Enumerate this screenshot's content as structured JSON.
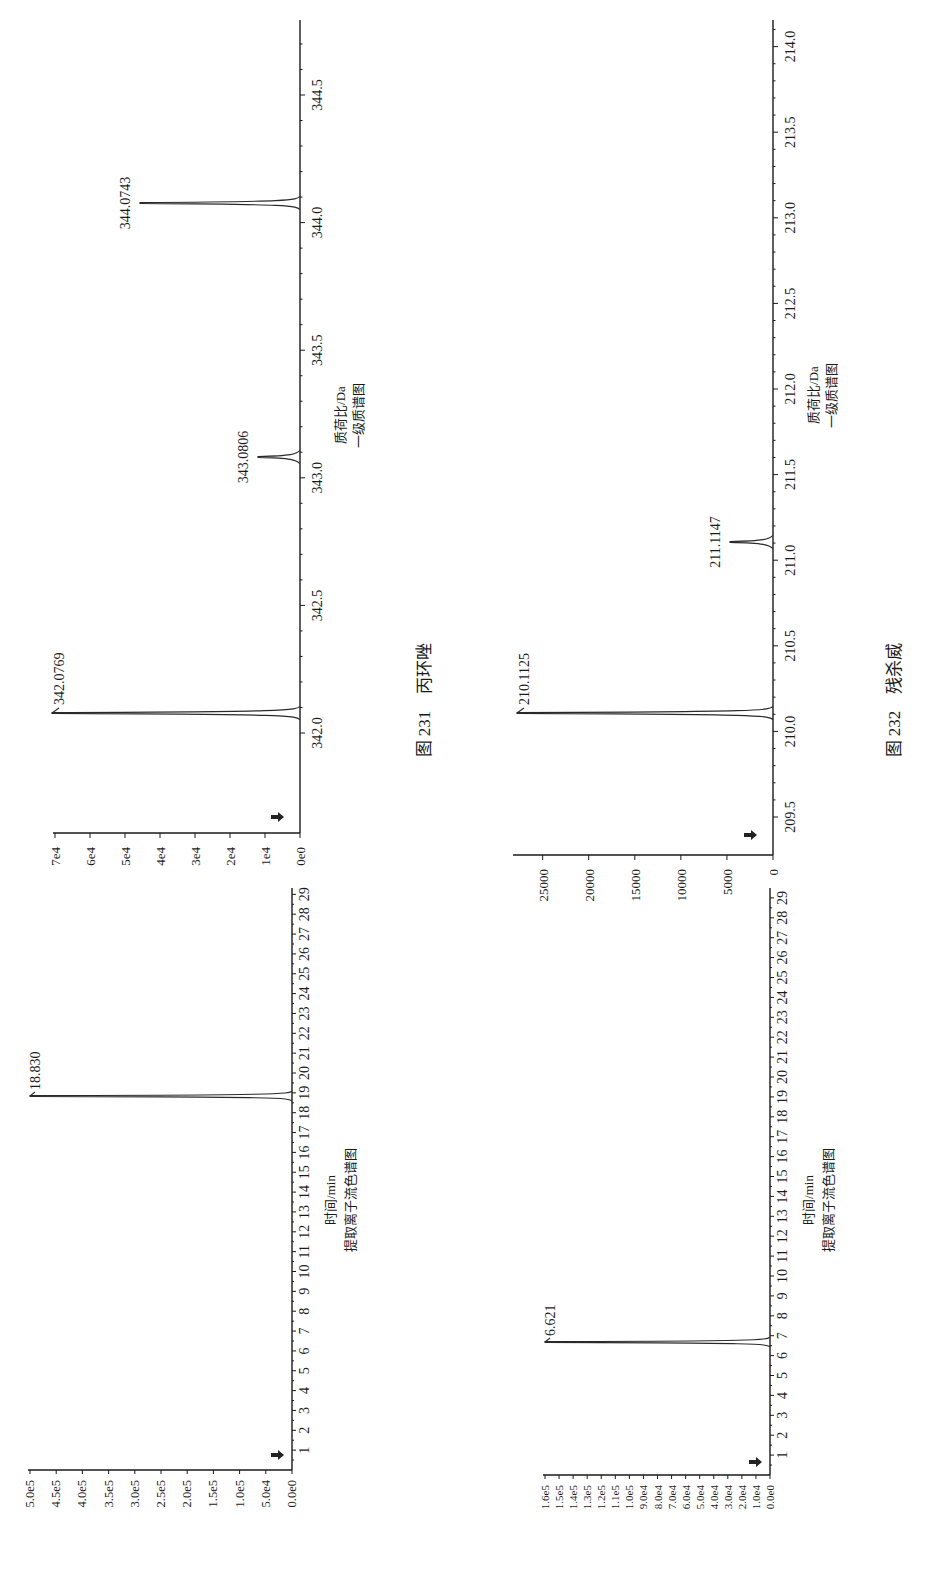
{
  "figures": [
    {
      "caption": "图 231　丙环唑",
      "ms": {
        "xlabel": "质荷比/Da",
        "title": "一级质谱图",
        "x_ticks": [
          "342.0",
          "342.5",
          "343.0",
          "343.5",
          "344.0",
          "344.5"
        ],
        "y_ticks": [
          "0e0",
          "1e4",
          "2e4",
          "3e4",
          "4e4",
          "5e4",
          "6e4",
          "7e4"
        ],
        "peaks": [
          {
            "label": "342.0769"
          },
          {
            "label": "343.0806"
          },
          {
            "label": "344.0743"
          }
        ]
      },
      "xic": {
        "xlabel": "时间/min",
        "title": "提取离子流色谱图",
        "y_ticks": [
          "0.0e0",
          "5.0e4",
          "1.0e5",
          "1.5e5",
          "2.0e5",
          "2.5e5",
          "3.0e5",
          "3.5e5",
          "4.0e5",
          "4.5e5",
          "5.0e5"
        ],
        "peak_label": "18.830"
      }
    },
    {
      "caption": "图 232　残杀威",
      "ms": {
        "xlabel": "质荷比/Da",
        "title": "一级质谱图",
        "x_ticks": [
          "209.5",
          "210.0",
          "210.5",
          "211.0",
          "211.5",
          "212.0",
          "212.5",
          "213.0",
          "213.5",
          "214.0"
        ],
        "y_ticks": [
          "0",
          "5000",
          "10000",
          "15000",
          "20000",
          "25000"
        ],
        "peaks": [
          {
            "label": "210.1125"
          },
          {
            "label": "211.1147"
          }
        ]
      },
      "xic": {
        "xlabel": "时间/min",
        "title": "提取离子流色谱图",
        "y_ticks": [
          "0.0e0",
          "1.0e4",
          "2.0e4",
          "3.0e4",
          "4.0e4",
          "5.0e4",
          "6.0e4",
          "7.0e4",
          "8.0e4",
          "9.0e4",
          "1.0e5",
          "1.1e5",
          "1.2e5",
          "1.3e5",
          "1.4e5",
          "1.5e5",
          "1.6e5"
        ],
        "peak_label": "6.621"
      }
    }
  ],
  "time_ticks": [
    "1",
    "2",
    "3",
    "4",
    "5",
    "6",
    "7",
    "8",
    "9",
    "10",
    "11",
    "12",
    "13",
    "14",
    "15",
    "16",
    "17",
    "18",
    "19",
    "20",
    "21",
    "22",
    "23",
    "24",
    "25",
    "26",
    "27",
    "28",
    "29"
  ],
  "chart_data": [
    {
      "type": "line",
      "title": "图 231 丙环唑 — 一级质谱图",
      "xlabel": "质荷比/Da",
      "ylabel": "",
      "xlim": [
        341.6,
        344.85
      ],
      "ylim": [
        0,
        70000
      ],
      "x_ticks": [
        342.0,
        342.5,
        343.0,
        343.5,
        344.0,
        344.5
      ],
      "y_ticks": [
        "0e0",
        "1e4",
        "2e4",
        "3e4",
        "4e4",
        "5e4",
        "6e4",
        "7e4"
      ],
      "series": [
        {
          "name": "MS",
          "x": [
            342.0769,
            343.0806,
            344.0743
          ],
          "values": [
            70000,
            12000,
            46000
          ]
        }
      ],
      "annotations": [
        "342.0769",
        "343.0806",
        "344.0743"
      ]
    },
    {
      "type": "line",
      "title": "图 231 丙环唑 — 提取离子流色谱图",
      "xlabel": "时间/min",
      "ylabel": "",
      "xlim": [
        0,
        29.3
      ],
      "ylim": [
        0,
        500000
      ],
      "x_ticks": [
        1,
        2,
        3,
        4,
        5,
        6,
        7,
        8,
        9,
        10,
        11,
        12,
        13,
        14,
        15,
        16,
        17,
        18,
        19,
        20,
        21,
        22,
        23,
        24,
        25,
        26,
        27,
        28,
        29
      ],
      "y_ticks": [
        "0.0e0",
        "5.0e4",
        "1.0e5",
        "1.5e5",
        "2.0e5",
        "2.5e5",
        "3.0e5",
        "3.5e5",
        "4.0e5",
        "4.5e5",
        "5.0e5"
      ],
      "series": [
        {
          "name": "XIC",
          "x": [
            18.83
          ],
          "values": [
            500000
          ]
        }
      ],
      "annotations": [
        "18.830"
      ]
    },
    {
      "type": "line",
      "title": "图 232 残杀威 — 一级质谱图",
      "xlabel": "质荷比/Da",
      "ylabel": "",
      "xlim": [
        209.25,
        214.15
      ],
      "ylim": [
        0,
        28000
      ],
      "x_ticks": [
        209.5,
        210.0,
        210.5,
        211.0,
        211.5,
        212.0,
        212.5,
        213.0,
        213.5,
        214.0
      ],
      "y_ticks": [
        0,
        5000,
        10000,
        15000,
        20000,
        25000
      ],
      "series": [
        {
          "name": "MS",
          "x": [
            210.1125,
            211.1147
          ],
          "values": [
            27800,
            4700
          ]
        }
      ],
      "annotations": [
        "210.1125",
        "211.1147"
      ]
    },
    {
      "type": "line",
      "title": "图 232 残杀威 — 提取离子流色谱图",
      "xlabel": "时间/min",
      "ylabel": "",
      "xlim": [
        0,
        29.3
      ],
      "ylim": [
        0,
        160000
      ],
      "x_ticks": [
        1,
        2,
        3,
        4,
        5,
        6,
        7,
        8,
        9,
        10,
        11,
        12,
        13,
        14,
        15,
        16,
        17,
        18,
        19,
        20,
        21,
        22,
        23,
        24,
        25,
        26,
        27,
        28,
        29
      ],
      "y_ticks": [
        "0.0e0",
        "1.0e4",
        "2.0e4",
        "3.0e4",
        "4.0e4",
        "5.0e4",
        "6.0e4",
        "7.0e4",
        "8.0e4",
        "9.0e4",
        "1.0e5",
        "1.1e5",
        "1.2e5",
        "1.3e5",
        "1.4e5",
        "1.5e5",
        "1.6e5"
      ],
      "series": [
        {
          "name": "XIC",
          "x": [
            6.621
          ],
          "values": [
            160000
          ]
        }
      ],
      "annotations": [
        "6.621"
      ]
    }
  ]
}
